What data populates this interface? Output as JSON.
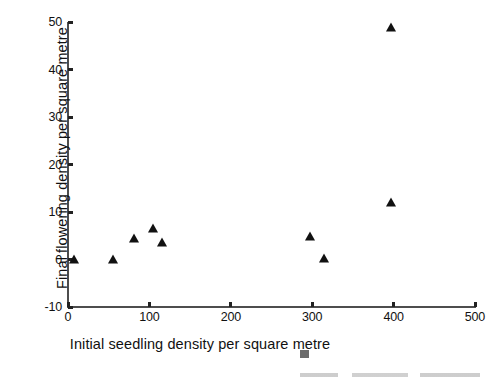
{
  "chart_data": {
    "type": "scatter",
    "title": "",
    "xlabel": "Initial seedling density per square metre",
    "ylabel": "Final flowering density per square metre",
    "xlim": [
      0,
      500
    ],
    "ylim": [
      -10,
      50
    ],
    "xticks": [
      0,
      100,
      200,
      300,
      400,
      500
    ],
    "yticks": [
      -10,
      0,
      10,
      20,
      30,
      40,
      50
    ],
    "xtick_labels": [
      "0",
      "100",
      "200",
      "300",
      "400",
      "500"
    ],
    "ytick_labels": [
      "-10",
      "0",
      "10",
      "20",
      "30",
      "40",
      "50"
    ],
    "grid": false,
    "legend": null,
    "marker": "triangle-up",
    "marker_color": "#111111",
    "axis_color": "#4d4d4d",
    "background": "#ffffff",
    "points": [
      {
        "x": 7,
        "y": 0.0
      },
      {
        "x": 55,
        "y": 0.0
      },
      {
        "x": 81,
        "y": 4.3
      },
      {
        "x": 104,
        "y": 6.4
      },
      {
        "x": 116,
        "y": 3.4
      },
      {
        "x": 297,
        "y": 4.7
      },
      {
        "x": 315,
        "y": 0.2
      },
      {
        "x": 397,
        "y": 11.8
      },
      {
        "x": 397,
        "y": 48.7
      }
    ]
  }
}
